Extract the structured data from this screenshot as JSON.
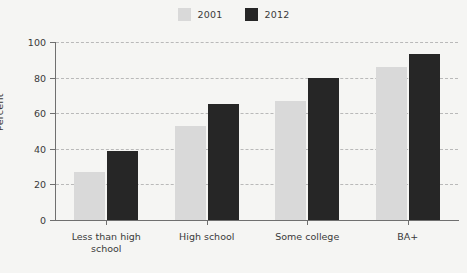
{
  "chart_data": {
    "type": "bar",
    "title": "",
    "subtitle": "",
    "xlabel": "",
    "ylabel": "Percent",
    "ylim": [
      0,
      100
    ],
    "yticks": [
      0,
      20,
      40,
      60,
      80,
      100
    ],
    "grid": true,
    "legend_position": "top-center",
    "categories": [
      "Less than high\nschool",
      "High school",
      "Some college",
      "BA+"
    ],
    "series": [
      {
        "name": "2001",
        "color": "#d9d9d9",
        "values": [
          27,
          53,
          67,
          86
        ]
      },
      {
        "name": "2012",
        "color": "#262626",
        "values": [
          39,
          65,
          80,
          93
        ]
      }
    ]
  },
  "legend": {
    "entries": [
      {
        "label": "2001",
        "swatch": "legend-swatch-2001"
      },
      {
        "label": "2012",
        "swatch": "legend-swatch-2012"
      }
    ]
  },
  "colors": {
    "background": "#f5f5f3",
    "series_2001": "#d9d9d9",
    "series_2012": "#262626",
    "axis": "#6f6f6f",
    "grid": "#b9b9b9",
    "text": "#3a3a3a"
  }
}
